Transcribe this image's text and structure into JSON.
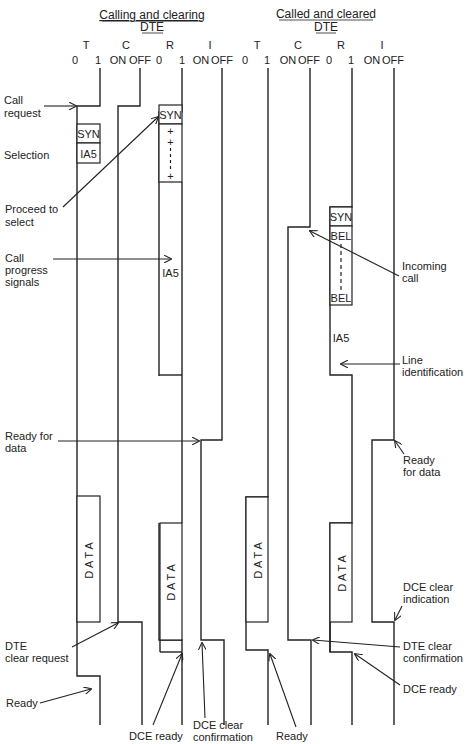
{
  "headers": {
    "calling": {
      "line1": "Calling and clearing",
      "line2": "DTE"
    },
    "called": {
      "line1": "Called and cleared",
      "line2": "DTE"
    }
  },
  "columns": {
    "calling": [
      {
        "name": "T",
        "states": [
          "0",
          "1"
        ]
      },
      {
        "name": "C",
        "states": [
          "ON",
          "OFF"
        ]
      },
      {
        "name": "R",
        "states": [
          "0",
          "1"
        ]
      },
      {
        "name": "I",
        "states": [
          "ON",
          "OFF"
        ]
      }
    ],
    "called": [
      {
        "name": "T",
        "states": [
          "0",
          "1"
        ]
      },
      {
        "name": "C",
        "states": [
          "ON",
          "OFF"
        ]
      },
      {
        "name": "R",
        "states": [
          "0",
          "1"
        ]
      },
      {
        "name": "I",
        "states": [
          "ON",
          "OFF"
        ]
      }
    ]
  },
  "boxes": {
    "syn": "SYN",
    "ia5": "IA5",
    "plus": "+",
    "bel": "BEL",
    "data": "DATA"
  },
  "labels": {
    "call_request": [
      "Call",
      "request"
    ],
    "selection": "Selection",
    "proceed_to_select": [
      "Proceed to",
      "select"
    ],
    "call_progress_signals": [
      "Call",
      "progress",
      "signals"
    ],
    "incoming_call": [
      "Incoming",
      "call"
    ],
    "line_identification": [
      "Line",
      "identification"
    ],
    "ready_for_data_left": [
      "Ready for",
      "data"
    ],
    "ready_for_data_right": [
      "Ready",
      "for data"
    ],
    "dce_clear_indication": [
      "DCE clear",
      "indication"
    ],
    "dte_clear_request": [
      "DTE",
      "clear request"
    ],
    "dte_clear_confirmation": [
      "DTE clear",
      "confirmation"
    ],
    "dce_ready_right": "DCE ready",
    "ready_left": "Ready",
    "dce_ready_bottom": "DCE ready",
    "dce_clear_confirmation": [
      "DCE clear",
      "confirmation"
    ],
    "ready_bottom": "Ready"
  }
}
